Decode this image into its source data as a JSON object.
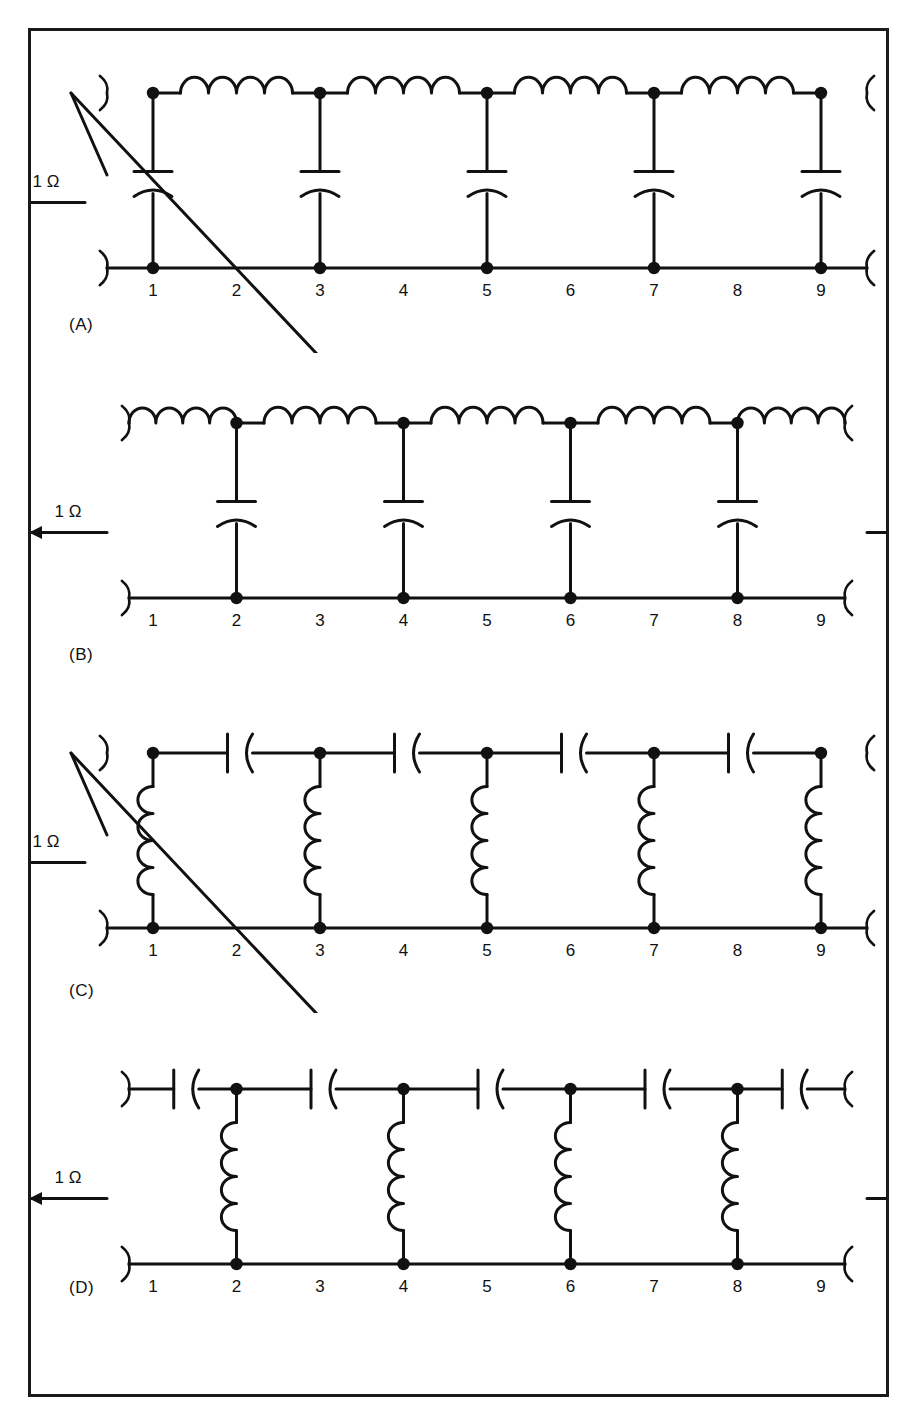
{
  "figure": {
    "background": "#ffffff",
    "ink": "#111111",
    "frame_color": "#1a1a1a"
  },
  "common": {
    "termination_label": "1 Ω",
    "node_numbers": [
      "1",
      "2",
      "3",
      "4",
      "5",
      "6",
      "7",
      "8",
      "9"
    ],
    "left_arrow_direction": "left",
    "right_arrow_direction": "right"
  },
  "circuits": [
    {
      "id": "A",
      "caption": "(A)",
      "caption_position": "below-left",
      "topology": "low-pass ladder, shunt-first",
      "series_element": "inductor",
      "shunt_element": "capacitor",
      "shunt_nodes": [
        "1",
        "3",
        "5",
        "7",
        "9"
      ],
      "series_count": 4,
      "shunt_count": 5,
      "left_termination": "1 Ω",
      "right_termination": "1 Ω",
      "node_numbers": [
        "1",
        "2",
        "3",
        "4",
        "5",
        "6",
        "7",
        "8",
        "9"
      ]
    },
    {
      "id": "B",
      "caption": "(B)",
      "caption_position": "below-left",
      "topology": "low-pass ladder, series-first",
      "series_element": "inductor",
      "shunt_element": "capacitor",
      "shunt_nodes": [
        "2",
        "4",
        "6",
        "8"
      ],
      "series_count": 5,
      "shunt_count": 4,
      "left_termination": "1 Ω",
      "right_termination": "1 Ω",
      "node_numbers": [
        "1",
        "2",
        "3",
        "4",
        "5",
        "6",
        "7",
        "8",
        "9"
      ]
    },
    {
      "id": "C",
      "caption": "(C)",
      "caption_position": "below-left",
      "topology": "high-pass ladder, shunt-first",
      "series_element": "capacitor",
      "shunt_element": "inductor",
      "shunt_nodes": [
        "1",
        "3",
        "5",
        "7",
        "9"
      ],
      "series_count": 4,
      "shunt_count": 5,
      "left_termination": "1 Ω",
      "right_termination": "1 Ω",
      "node_numbers": [
        "1",
        "2",
        "3",
        "4",
        "5",
        "6",
        "7",
        "8",
        "9"
      ]
    },
    {
      "id": "D",
      "caption": "(D)",
      "caption_position": "inline-left",
      "topology": "high-pass ladder, series-first",
      "series_element": "capacitor",
      "shunt_element": "inductor",
      "shunt_nodes": [
        "2",
        "4",
        "6",
        "8"
      ],
      "series_count": 5,
      "shunt_count": 4,
      "left_termination": "1 Ω",
      "right_termination": "1 Ω",
      "node_numbers": [
        "1",
        "2",
        "3",
        "4",
        "5",
        "6",
        "7",
        "8",
        "9"
      ]
    }
  ]
}
